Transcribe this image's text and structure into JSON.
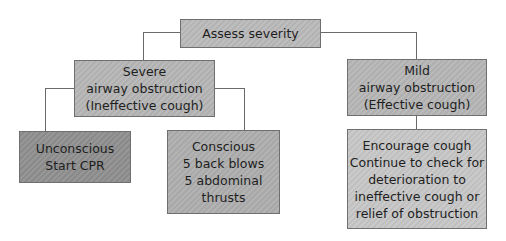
{
  "diagram": {
    "type": "flowchart",
    "colors": {
      "root": "#b9b9b9",
      "level1": "#b5b5b5",
      "unconscious": "#8e8e8e",
      "conscious": "#adadad",
      "mild_action": "#c6c6c6",
      "border": "#6f6f6f",
      "connector": "#6a6a6a"
    },
    "nodes": {
      "root": {
        "lines": [
          "Assess severity"
        ]
      },
      "severe": {
        "lines": [
          "Severe",
          "airway obstruction",
          "(Ineffective cough)"
        ]
      },
      "mild": {
        "lines": [
          "Mild",
          "airway obstruction",
          "(Effective cough)"
        ]
      },
      "unconscious": {
        "lines": [
          "Unconscious",
          "Start CPR"
        ]
      },
      "conscious": {
        "lines": [
          "Conscious",
          "5 back blows",
          "5 abdominal",
          "thrusts"
        ]
      },
      "mild_action": {
        "lines": [
          "Encourage cough",
          "Continue to check for",
          "deterioration to",
          "ineffective cough or",
          "relief of obstruction"
        ]
      }
    },
    "edges": [
      {
        "from": "root",
        "to": "severe"
      },
      {
        "from": "root",
        "to": "mild"
      },
      {
        "from": "severe",
        "to": "unconscious"
      },
      {
        "from": "severe",
        "to": "conscious"
      },
      {
        "from": "mild",
        "to": "mild_action"
      }
    ]
  }
}
